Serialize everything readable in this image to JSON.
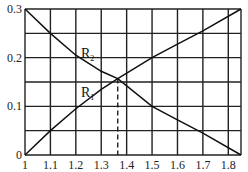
{
  "chart_data": {
    "type": "line",
    "title": "",
    "xlabel": "",
    "ylabel": "",
    "xlim": [
      1,
      1.85
    ],
    "ylim": [
      0,
      0.3
    ],
    "grid": true,
    "x_ticks": [
      "1",
      "1.1",
      "1.2",
      "1.3",
      "1.4",
      "1.5",
      "1.6",
      "1.7",
      "1.8"
    ],
    "y_ticks": [
      "0",
      "0.1",
      "0.2",
      "0.3"
    ],
    "x_grid": [
      1.0,
      1.1,
      1.2,
      1.3,
      1.4,
      1.5,
      1.6,
      1.7,
      1.8,
      1.85
    ],
    "y_grid": [
      0,
      0.05,
      0.1,
      0.15,
      0.2,
      0.25,
      0.3
    ],
    "series": [
      {
        "name": "R1",
        "label_main": "R",
        "label_sub": "1",
        "x": [
          1.0,
          1.1,
          1.2,
          1.3,
          1.365,
          1.5,
          1.6,
          1.7,
          1.85
        ],
        "y": [
          0.0,
          0.05,
          0.095,
          0.135,
          0.157,
          0.2,
          0.228,
          0.255,
          0.3
        ]
      },
      {
        "name": "R2",
        "label_main": "R",
        "label_sub": "2",
        "x": [
          1.0,
          1.1,
          1.2,
          1.3,
          1.365,
          1.5,
          1.6,
          1.7,
          1.85
        ],
        "y": [
          0.3,
          0.25,
          0.205,
          0.172,
          0.157,
          0.1,
          0.072,
          0.045,
          0.0
        ]
      }
    ],
    "annotations": [
      {
        "type": "dashed-vline",
        "x": 1.365,
        "y_from": 0,
        "y_to": 0.157,
        "text": "intersection of R1 and R2"
      }
    ]
  }
}
